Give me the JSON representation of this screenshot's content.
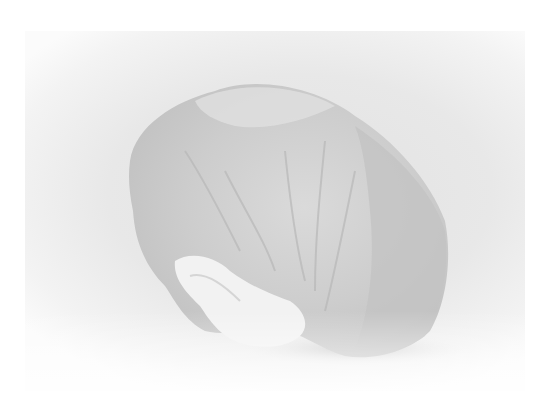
{
  "image": {
    "subject": "crumpled white disposable bouffant cap",
    "style": "grayscale product photo on light background",
    "colors": {
      "background": "#ffffff",
      "backdrop": "#e6e6e6",
      "cap_light": "#ececec",
      "cap_mid": "#d2d2d2",
      "cap_shadow": "#bdbdbd",
      "ground_shadow": "#c8c8c8"
    }
  }
}
